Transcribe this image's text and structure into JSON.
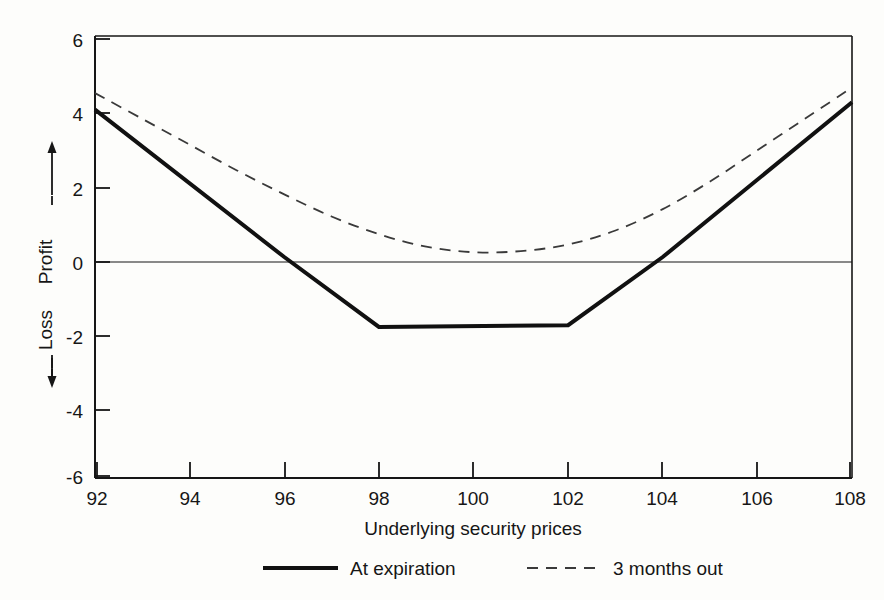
{
  "chart_data": {
    "type": "line",
    "title": "",
    "xlabel": "Underlying security prices",
    "ylabel_up": "Profit",
    "ylabel_down": "Loss",
    "ylabel_up_arrow": "↑",
    "ylabel_down_arrow": "↓",
    "xlim": [
      92,
      108
    ],
    "ylim": [
      -6,
      6
    ],
    "grid": false,
    "zero_line": true,
    "legend_position": "below-axis-center",
    "xticks": [
      92,
      94,
      96,
      98,
      100,
      102,
      104,
      106,
      108
    ],
    "xtick_labels": [
      "92",
      "94",
      "96",
      "98",
      "100",
      "102",
      "104",
      "106",
      "108"
    ],
    "yticks": [
      -6,
      -4,
      -2,
      0,
      2,
      4,
      6
    ],
    "ytick_labels": [
      "-6",
      "-4",
      "-2",
      "0",
      "2",
      "4",
      "6"
    ],
    "series": [
      {
        "name": "At expiration",
        "style": "solid",
        "color": "#111111",
        "width": 4,
        "x": [
          92,
          96,
          98,
          102,
          104,
          108
        ],
        "values": [
          4.0,
          0.0,
          -1.9,
          -1.85,
          0.0,
          4.2
        ]
      },
      {
        "name": "3 months out",
        "style": "dashed",
        "color": "#3a3a3a",
        "width": 1.8,
        "x": [
          92,
          93,
          94,
          95,
          96,
          97,
          98,
          99,
          100,
          101,
          102,
          103,
          104,
          105,
          106,
          107,
          108
        ],
        "values": [
          4.45,
          3.75,
          3.05,
          2.35,
          1.7,
          1.1,
          0.62,
          0.28,
          0.13,
          0.16,
          0.34,
          0.72,
          1.3,
          2.05,
          2.9,
          3.75,
          4.6
        ]
      }
    ]
  },
  "legend": {
    "items": [
      {
        "label": "At expiration",
        "style": "solid"
      },
      {
        "label": "3 months out",
        "style": "dashed"
      }
    ]
  },
  "colors": {
    "background": "#fdfdfb",
    "axis": "#161616",
    "solid_series": "#111111",
    "dashed_series": "#3a3a3a",
    "text": "#161616"
  }
}
